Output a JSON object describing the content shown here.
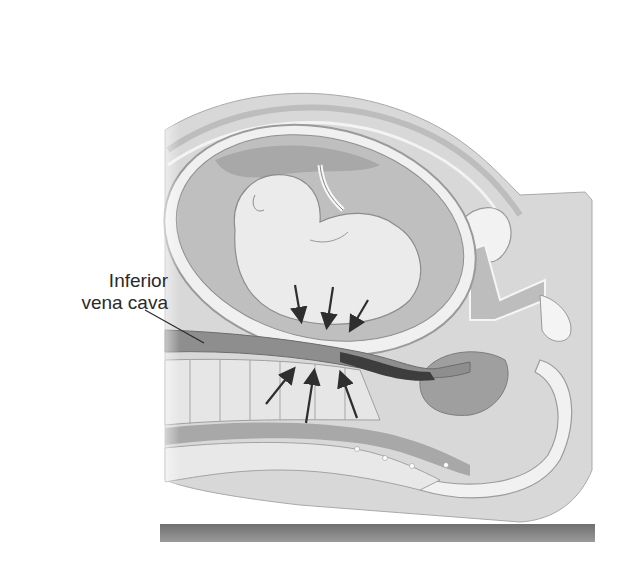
{
  "figure": {
    "type": "anatomical-illustration",
    "labels": [
      {
        "id": "ivc",
        "line1": "Inferior",
        "line2": "vena cava"
      }
    ],
    "arrows": {
      "downward_count": 3,
      "upward_count": 3
    },
    "colors": {
      "background": "#ffffff",
      "skin": "#d6d6d6",
      "uterus_wall": "#cfcfcf",
      "fetus": "#e9e9e9",
      "vessel": "#8e8e8e",
      "spine": "#e4e4e4",
      "table": "#8a8a8a",
      "arrow": "#2e2e2e"
    }
  }
}
